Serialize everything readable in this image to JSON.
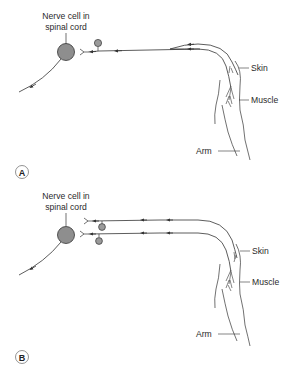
{
  "figure": {
    "panels": [
      {
        "id": "A",
        "letter": "A",
        "labels": {
          "cell_line1": "Nerve cell in",
          "cell_line2": "spinal cord",
          "skin": "Skin",
          "muscle": "Muscle",
          "arm": "Arm"
        },
        "description": "Single sensory fibre from skin and muscle converging onto one afferent neuron with a ganglion cell body, synapsing on a spinal cord nerve cell; motor output exits downward-left."
      },
      {
        "id": "B",
        "letter": "B",
        "labels": {
          "cell_line1": "Nerve cell in",
          "cell_line2": "spinal cord",
          "skin": "Skin",
          "muscle": "Muscle",
          "arm": "Arm"
        },
        "description": "Two separate sensory fibres (one from skin, one from muscle), each with its own ganglion cell body, synapsing separately near the spinal cord nerve cell; motor output exits downward-left."
      }
    ],
    "colors": {
      "cell_fill": "#8e8e8e",
      "stroke": "#333333",
      "ganglion_fill": "#9a9a9a"
    }
  }
}
